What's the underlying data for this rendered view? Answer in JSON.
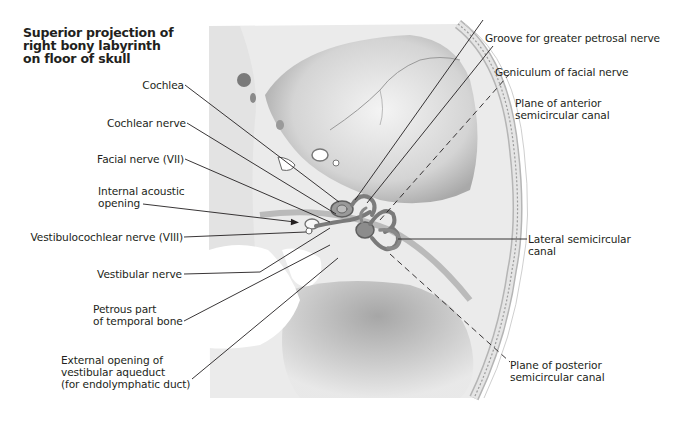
{
  "figure": {
    "title": "Superior projection of\nright bony labyrinth\non floor of skull",
    "colors": {
      "background": "#ffffff",
      "bone_light": "#ececec",
      "bone_mid": "#c9c9c9",
      "bone_dark": "#8f8f8f",
      "labyrinth": "#7d7d7d",
      "leader_line": "#231f20",
      "text": "#231f20"
    },
    "labels_left": [
      {
        "id": "cochlea",
        "text": "Cochlea"
      },
      {
        "id": "cochlear-nerve",
        "text": "Cochlear nerve"
      },
      {
        "id": "facial-nerve",
        "text": "Facial nerve (VII)"
      },
      {
        "id": "internal-acoustic-opening",
        "text": "Internal acoustic\nopening"
      },
      {
        "id": "vestibulocochlear-nerve",
        "text": "Vestibulocochlear nerve (VIII)"
      },
      {
        "id": "vestibular-nerve",
        "text": "Vestibular nerve"
      },
      {
        "id": "petrous-part",
        "text": "Petrous part\nof temporal bone"
      },
      {
        "id": "vestibular-aqueduct",
        "text": "External opening of\nvestibular aqueduct\n(for endolymphatic duct)"
      }
    ],
    "labels_right": [
      {
        "id": "groove-greater-petrosal",
        "text": "Groove for greater petrosal nerve"
      },
      {
        "id": "geniculum",
        "text": "Geniculum of facial nerve"
      },
      {
        "id": "plane-anterior",
        "text": "Plane of anterior\nsemicircular canal",
        "line_style": "dashed"
      },
      {
        "id": "lateral-canal",
        "text": "Lateral semicircular\ncanal"
      },
      {
        "id": "plane-posterior",
        "text": "Plane of posterior\nsemicircular canal",
        "line_style": "dashed"
      }
    ]
  }
}
